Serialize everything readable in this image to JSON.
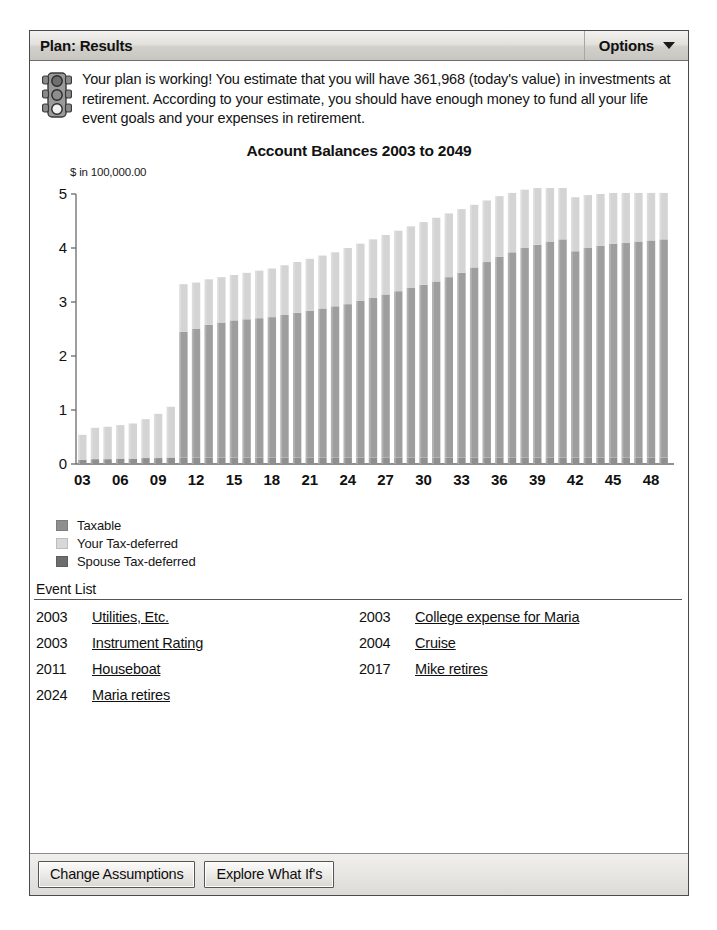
{
  "window": {
    "title": "Plan: Results",
    "options_label": "Options",
    "chevron_icon": "chevron-down-icon"
  },
  "message": {
    "icon": "traffic-light-icon",
    "text": "Your plan is working! You estimate that you will have 361,968 (today's value) in investments at retirement. According to your estimate, you should have enough money to fund all your life event goals and your expenses in retirement.",
    "estimate_value": "361,968"
  },
  "chart_data": {
    "type": "bar",
    "stacked": true,
    "title": "Account Balances 2003 to 2049",
    "xlabel": "",
    "ylabel": "$ in 100,000.00",
    "ylim": [
      0,
      5
    ],
    "yticks": [
      0,
      1,
      2,
      3,
      4,
      5
    ],
    "ytick_labels": [
      "0",
      "1",
      "2",
      "3",
      "4",
      "5"
    ],
    "grid": false,
    "legend_position": "below-left",
    "x": [
      "03",
      "04",
      "05",
      "06",
      "07",
      "08",
      "09",
      "10",
      "11",
      "12",
      "13",
      "14",
      "15",
      "16",
      "17",
      "18",
      "19",
      "20",
      "21",
      "22",
      "23",
      "24",
      "25",
      "26",
      "27",
      "28",
      "29",
      "30",
      "31",
      "32",
      "33",
      "34",
      "35",
      "36",
      "37",
      "38",
      "39",
      "40",
      "41",
      "42",
      "43",
      "44",
      "45",
      "46",
      "47",
      "48",
      "49"
    ],
    "xtick_labels": [
      "03",
      "06",
      "09",
      "12",
      "15",
      "18",
      "21",
      "24",
      "27",
      "30",
      "33",
      "36",
      "39",
      "42",
      "45",
      "48"
    ],
    "xtick_every": 3,
    "series": [
      {
        "name": "Taxable",
        "color": "#8f8f8f",
        "values": [
          0.08,
          0.09,
          0.09,
          0.1,
          0.1,
          0.11,
          0.11,
          0.12,
          0.12,
          0.12,
          0.12,
          0.12,
          0.12,
          0.12,
          0.12,
          0.12,
          0.12,
          0.12,
          0.12,
          0.12,
          0.12,
          0.12,
          0.12,
          0.12,
          0.12,
          0.12,
          0.12,
          0.12,
          0.12,
          0.12,
          0.12,
          0.12,
          0.12,
          0.12,
          0.12,
          0.12,
          0.12,
          0.12,
          0.12,
          0.12,
          0.12,
          0.12,
          0.12,
          0.12,
          0.12,
          0.12,
          0.12
        ]
      },
      {
        "name": "Your Tax-deferred",
        "color": "#d2d2d2",
        "values": [
          0.46,
          0.58,
          0.6,
          0.62,
          0.65,
          0.72,
          0.82,
          0.94,
          0.88,
          0.86,
          0.84,
          0.84,
          0.84,
          0.86,
          0.88,
          0.9,
          0.92,
          0.94,
          0.96,
          0.98,
          1.0,
          1.04,
          1.06,
          1.08,
          1.1,
          1.12,
          1.14,
          1.16,
          1.18,
          1.18,
          1.18,
          1.16,
          1.14,
          1.12,
          1.1,
          1.08,
          1.06,
          1.04,
          1.02,
          1.0,
          0.98,
          0.96,
          0.94,
          0.92,
          0.9,
          0.88,
          0.86
        ]
      },
      {
        "name": "Spouse Tax-deferred",
        "color": "#9a9a9a",
        "values": [
          0.0,
          0.0,
          0.0,
          0.0,
          0.0,
          0.0,
          0.0,
          0.0,
          2.33,
          2.38,
          2.46,
          2.5,
          2.54,
          2.56,
          2.58,
          2.6,
          2.64,
          2.68,
          2.72,
          2.76,
          2.8,
          2.84,
          2.9,
          2.96,
          3.02,
          3.08,
          3.14,
          3.2,
          3.26,
          3.34,
          3.42,
          3.52,
          3.62,
          3.72,
          3.8,
          3.88,
          3.94,
          4.0,
          4.04,
          3.82,
          3.88,
          3.92,
          3.96,
          3.98,
          4.0,
          4.02,
          4.04
        ]
      }
    ],
    "totals": [
      0.54,
      0.67,
      0.69,
      0.72,
      0.75,
      0.83,
      0.93,
      1.06,
      3.33,
      3.36,
      3.42,
      3.46,
      3.5,
      3.54,
      3.58,
      3.62,
      3.68,
      3.74,
      3.8,
      3.86,
      3.92,
      4.0,
      4.08,
      4.16,
      4.24,
      4.32,
      4.4,
      4.48,
      4.56,
      4.64,
      4.72,
      4.8,
      4.88,
      4.96,
      5.02,
      5.08,
      5.12,
      5.16,
      5.18,
      4.94,
      4.98,
      5.0,
      5.02,
      5.02,
      5.02,
      5.02,
      5.02
    ]
  },
  "legend": [
    {
      "label": "Taxable",
      "color": "#8f8f8f",
      "swatch_icon": "legend-swatch-taxable"
    },
    {
      "label": "Your Tax-deferred",
      "color": "#d2d2d2",
      "swatch_icon": "legend-swatch-your-tax-deferred"
    },
    {
      "label": "Spouse Tax-deferred",
      "color": "#6d6d6d",
      "swatch_icon": "legend-swatch-spouse-tax-deferred"
    }
  ],
  "event_list": {
    "title": "Event List",
    "rows": [
      {
        "left_year": "2003",
        "left_name": "Utilities, Etc.",
        "right_year": "2003",
        "right_name": "College expense for Maria"
      },
      {
        "left_year": "2003",
        "left_name": "Instrument Rating",
        "right_year": "2004",
        "right_name": "Cruise"
      },
      {
        "left_year": "2011",
        "left_name": "Houseboat",
        "right_year": "2017",
        "right_name": "Mike retires"
      },
      {
        "left_year": "2024",
        "left_name": "Maria retires",
        "right_year": "",
        "right_name": ""
      }
    ]
  },
  "footer": {
    "change_assumptions_label": "Change Assumptions",
    "explore_what_ifs_label": "Explore What If's"
  }
}
